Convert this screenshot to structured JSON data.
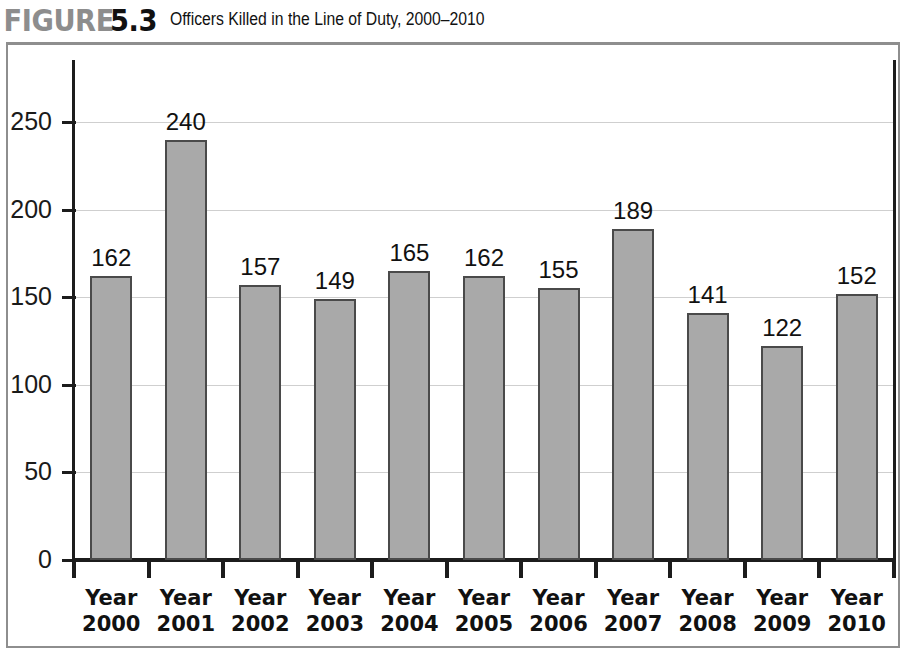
{
  "figure": {
    "label_word": "FIGURE",
    "label_number": "5.3",
    "caption": "Officers Killed in the Line of Duty, 2000–2010"
  },
  "style": {
    "bar_fill": "#a9a9a9",
    "bar_stroke": "#4a4a4a",
    "gridline_color": "#cfcfcf",
    "axis_color": "#1c1c1c",
    "frame_color": "#8e8e8e",
    "figure_word_color": "#8d8d8d",
    "figure_number_color": "#111111"
  },
  "chart_data": {
    "type": "bar",
    "title": "Officers Killed in the Line of Duty, 2000–2010",
    "xlabel": "",
    "ylabel": "",
    "grid": true,
    "legend": "none",
    "ylim": [
      0,
      280
    ],
    "yticks": [
      0,
      50,
      100,
      150,
      200,
      250
    ],
    "ytick_labels": [
      "0",
      "50",
      "100",
      "150",
      "200",
      "250"
    ],
    "categories": [
      "Year 2000",
      "Year 2001",
      "Year 2002",
      "Year 2003",
      "Year 2004",
      "Year 2005",
      "Year 2006",
      "Year 2007",
      "Year 2008",
      "Year 2009",
      "Year 2010"
    ],
    "category_lines": [
      [
        "Year",
        "2000"
      ],
      [
        "Year",
        "2001"
      ],
      [
        "Year",
        "2002"
      ],
      [
        "Year",
        "2003"
      ],
      [
        "Year",
        "2004"
      ],
      [
        "Year",
        "2005"
      ],
      [
        "Year",
        "2006"
      ],
      [
        "Year",
        "2007"
      ],
      [
        "Year",
        "2008"
      ],
      [
        "Year",
        "2009"
      ],
      [
        "Year",
        "2010"
      ]
    ],
    "values": [
      162,
      240,
      157,
      149,
      165,
      162,
      155,
      189,
      141,
      122,
      152
    ],
    "value_labels": [
      "162",
      "240",
      "157",
      "149",
      "165",
      "162",
      "155",
      "189",
      "141",
      "122",
      "152"
    ]
  }
}
